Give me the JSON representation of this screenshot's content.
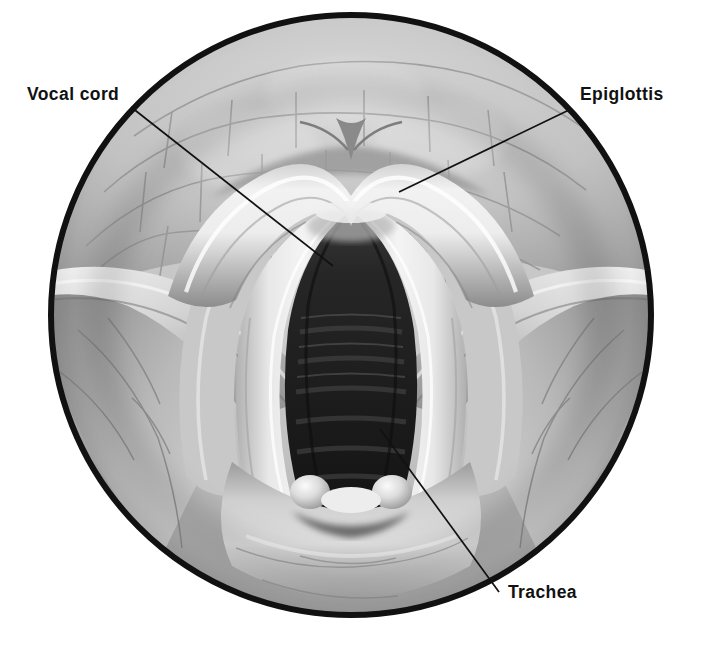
{
  "figure": {
    "type": "anatomical-illustration",
    "background_color": "#ffffff",
    "canvas": {
      "width": 701,
      "height": 647
    }
  },
  "viewport": {
    "shape": "circle",
    "center_x": 351,
    "center_y": 315,
    "radius": 303,
    "border_color": "#111111",
    "border_width": 6,
    "fill_color": "#b9b9b9"
  },
  "labels": [
    {
      "id": "vocal-cord",
      "text": "Vocal cord",
      "x": 27,
      "y": 86,
      "color": "#111111",
      "leader": {
        "x1": 131,
        "y1": 107,
        "x2": 333,
        "y2": 266
      }
    },
    {
      "id": "epiglottis",
      "text": "Epiglottis",
      "x": 580,
      "y": 86,
      "color": "#111111",
      "leader": {
        "x1": 569,
        "y1": 110,
        "x2": 399,
        "y2": 192
      }
    },
    {
      "id": "trachea",
      "text": "Trachea",
      "x": 508,
      "y": 584,
      "color": "#111111",
      "leader": {
        "x1": 380,
        "y1": 429,
        "x2": 499,
        "y2": 592
      }
    }
  ],
  "structures": [
    {
      "id": "tongue-base",
      "name": "Base of tongue / lingual tonsil",
      "texture": "cobblestone"
    },
    {
      "id": "vallecula",
      "name": "Vallecula"
    },
    {
      "id": "epiglottis-body",
      "name": "Epiglottis"
    },
    {
      "id": "aryepiglottic-fold-left",
      "name": "Left aryepiglottic fold"
    },
    {
      "id": "aryepiglottic-fold-right",
      "name": "Right aryepiglottic fold"
    },
    {
      "id": "false-cord-left",
      "name": "Left ventricular (false) cord"
    },
    {
      "id": "false-cord-right",
      "name": "Right ventricular (false) cord"
    },
    {
      "id": "vocal-cord-left",
      "name": "Left true vocal cord"
    },
    {
      "id": "vocal-cord-right",
      "name": "Right true vocal cord"
    },
    {
      "id": "glottis",
      "name": "Glottic opening (rima glottidis)"
    },
    {
      "id": "trachea-rings",
      "name": "Tracheal rings",
      "count": 9
    },
    {
      "id": "arytenoid-left",
      "name": "Left arytenoid (corniculate) tubercle"
    },
    {
      "id": "arytenoid-right",
      "name": "Right arytenoid (corniculate) tubercle"
    },
    {
      "id": "interarytenoid",
      "name": "Interarytenoid notch"
    },
    {
      "id": "posterior-wall",
      "name": "Posterior pharyngeal wall"
    },
    {
      "id": "pyriform-sinus-left",
      "name": "Left pyriform sinus"
    },
    {
      "id": "pyriform-sinus-right",
      "name": "Right pyriform sinus"
    }
  ],
  "palette": {
    "ink": "#111111",
    "tissue_light": "#e6e6e6",
    "tissue_mid": "#bdbdbd",
    "tissue_dark": "#8a8a8a",
    "shadow": "#5e5e5e",
    "airway_dark": "#2a2a2a",
    "airway_deep": "#161616",
    "cord_white": "#f2f2f2",
    "vessel": "#7d7d7d"
  }
}
